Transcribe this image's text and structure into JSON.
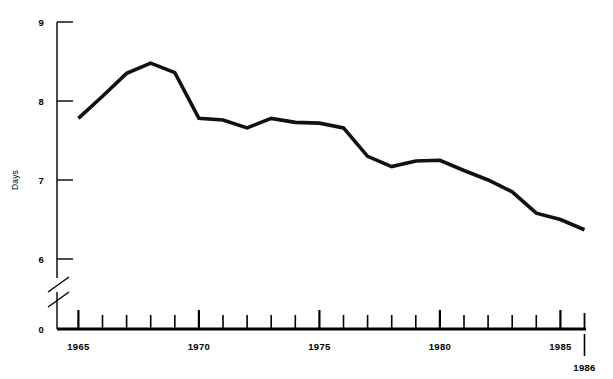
{
  "chart_data": {
    "type": "line",
    "title": "",
    "subtitle": "",
    "xlabel": "",
    "ylabel": "Days",
    "xlim": [
      1964,
      1986
    ],
    "ylim": [
      6,
      9
    ],
    "y_axis_break": true,
    "y_axis_break_note": "axis broken between 0 and 6",
    "grid": false,
    "legend": false,
    "y_ticks": [
      "9",
      "8",
      "7",
      "6",
      "0"
    ],
    "y_tick_values": [
      9,
      8,
      7,
      6,
      0
    ],
    "x_ticks_labeled": [
      "1965",
      "1970",
      "1975",
      "1980",
      "1985",
      "1986"
    ],
    "x_tick_values_labeled": [
      1965,
      1970,
      1975,
      1980,
      1985,
      1986
    ],
    "x_minor_ticks": [
      1966,
      1967,
      1968,
      1969,
      1971,
      1972,
      1973,
      1974,
      1976,
      1977,
      1978,
      1979,
      1981,
      1982,
      1983,
      1984
    ],
    "x": [
      1965,
      1966,
      1967,
      1968,
      1969,
      1970,
      1971,
      1972,
      1973,
      1974,
      1975,
      1976,
      1977,
      1978,
      1979,
      1980,
      1981,
      1982,
      1983,
      1984,
      1985,
      1986
    ],
    "values": [
      7.78,
      8.06,
      8.35,
      8.48,
      8.36,
      7.78,
      7.76,
      7.66,
      7.78,
      7.73,
      7.72,
      7.66,
      7.3,
      7.17,
      7.24,
      7.25,
      7.12,
      7.0,
      6.85,
      6.58,
      6.5,
      6.37
    ],
    "series": [
      {
        "name": "Days",
        "color": "#111111",
        "values": [
          7.78,
          8.06,
          8.35,
          8.48,
          8.36,
          7.78,
          7.76,
          7.66,
          7.78,
          7.73,
          7.72,
          7.66,
          7.3,
          7.17,
          7.24,
          7.25,
          7.12,
          7.0,
          6.85,
          6.58,
          6.5,
          6.37
        ]
      }
    ]
  },
  "axis": {
    "y_label": "Days",
    "y_tick_9": "9",
    "y_tick_8": "8",
    "y_tick_7": "7",
    "y_tick_6": "6",
    "y_tick_0": "0",
    "x_tick_1965": "1965",
    "x_tick_1970": "1970",
    "x_tick_1975": "1975",
    "x_tick_1980": "1980",
    "x_tick_1985": "1985",
    "x_tick_1986": "1986"
  },
  "colors": {
    "line": "#111111",
    "axis": "#000000",
    "background": "#ffffff"
  }
}
